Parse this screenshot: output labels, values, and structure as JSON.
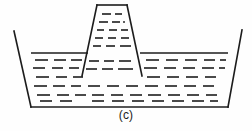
{
  "figure": {
    "caption": "(c)",
    "background_color": "#fefefe",
    "line_color": "#1c1c1c",
    "dash_color": "#2a2a2a"
  },
  "chart_data": {
    "type": "diagram",
    "title": "(c)",
    "canvas": {
      "width": 252,
      "height": 131
    },
    "elements": {
      "vessel": {
        "name": "vessel-outline",
        "left_wall": {
          "x1": 14,
          "y1": 31,
          "x2": 31,
          "y2": 107
        },
        "bottom": {
          "x1": 31,
          "y1": 107,
          "x2": 228,
          "y2": 107
        },
        "right_wall": {
          "x1": 228,
          "y1": 107,
          "x2": 242,
          "y2": 30
        }
      },
      "free_surface": {
        "name": "liquid-surface-line",
        "level_y": 53,
        "left_segment": {
          "x1": 31,
          "y1": 53,
          "x2": 88,
          "y2": 53
        },
        "right_segment": {
          "x1": 140,
          "y1": 53,
          "x2": 228,
          "y2": 53
        }
      },
      "standpipe": {
        "name": "standpipe-outline",
        "top_edge": {
          "x1": 97,
          "y1": 5,
          "x2": 127,
          "y2": 5
        },
        "left_wall": {
          "x1": 97,
          "y1": 5,
          "x2": 82,
          "y2": 76
        },
        "right_wall": {
          "x1": 127,
          "y1": 5,
          "x2": 142,
          "y2": 76
        },
        "rise_above_surface": 48
      }
    },
    "hatching": {
      "style": "short horizontal dashes",
      "standpipe_rows": [
        {
          "y": 14,
          "dashes": [
            [
              102,
              111
            ],
            [
              115,
              122
            ]
          ]
        },
        {
          "y": 22,
          "dashes": [
            [
              99,
              108
            ],
            [
              112,
              120
            ],
            [
              123,
              125
            ]
          ]
        },
        {
          "y": 30,
          "dashes": [
            [
              97,
              104
            ],
            [
              109,
              117
            ],
            [
              121,
              128
            ]
          ]
        },
        {
          "y": 38,
          "dashes": [
            [
              95,
              103
            ],
            [
              108,
              116
            ],
            [
              121,
              129
            ]
          ]
        },
        {
          "y": 46,
          "dashes": [
            [
              93,
              101
            ],
            [
              106,
              115
            ],
            [
              120,
              131
            ]
          ]
        },
        {
          "y": 61,
          "dashes": [
            [
              89,
              99
            ],
            [
              104,
              114
            ],
            [
              119,
              131
            ]
          ]
        },
        {
          "y": 69,
          "dashes": [
            [
              86,
              97
            ],
            [
              102,
              113
            ],
            [
              118,
              133
            ]
          ]
        }
      ],
      "left_pool_rows": [
        {
          "y": 60,
          "dashes": [
            [
              35,
              48
            ],
            [
              54,
              66
            ],
            [
              71,
              82
            ]
          ]
        },
        {
          "y": 68,
          "dashes": [
            [
              33,
              45
            ],
            [
              52,
              63
            ],
            [
              69,
              79
            ]
          ]
        },
        {
          "y": 77,
          "dashes": [
            [
              36,
              49
            ],
            [
              56,
              67
            ],
            [
              73,
              83
            ]
          ]
        },
        {
          "y": 86,
          "dashes": [
            [
              34,
              47
            ],
            [
              53,
              65
            ],
            [
              71,
              81
            ]
          ]
        },
        {
          "y": 95,
          "dashes": [
            [
              37,
              50
            ],
            [
              57,
              69
            ],
            [
              75,
              86
            ]
          ]
        },
        {
          "y": 101,
          "dashes": [
            [
              40,
              52
            ],
            [
              60,
              72
            ]
          ]
        }
      ],
      "right_pool_rows": [
        {
          "y": 60,
          "dashes": [
            [
              146,
              159
            ],
            [
              166,
              178
            ],
            [
              185,
              197
            ],
            [
              204,
              215
            ],
            [
              220,
              226
            ]
          ]
        },
        {
          "y": 68,
          "dashes": [
            [
              144,
              157
            ],
            [
              164,
              176
            ],
            [
              183,
              195
            ],
            [
              202,
              214
            ],
            [
              219,
              225
            ]
          ]
        },
        {
          "y": 77,
          "dashes": [
            [
              147,
              160
            ],
            [
              167,
              179
            ],
            [
              186,
              198
            ],
            [
              205,
              216
            ]
          ]
        },
        {
          "y": 86,
          "dashes": [
            [
              145,
              158
            ],
            [
              165,
              177
            ],
            [
              184,
              196
            ],
            [
              203,
              214
            ]
          ]
        },
        {
          "y": 95,
          "dashes": [
            [
              148,
              161
            ],
            [
              168,
              180
            ],
            [
              187,
              199
            ],
            [
              206,
              217
            ]
          ]
        },
        {
          "y": 101,
          "dashes": [
            [
              92,
              104
            ],
            [
              112,
              124
            ],
            [
              132,
              144
            ],
            [
              152,
              164
            ],
            [
              172,
              184
            ],
            [
              192,
              204
            ],
            [
              210,
              218
            ]
          ]
        }
      ],
      "center_pool_rows": [
        {
          "y": 86,
          "dashes": [
            [
              88,
              100
            ],
            [
              107,
              119
            ],
            [
              126,
              138
            ]
          ]
        },
        {
          "y": 95,
          "dashes": [
            [
              92,
              104
            ],
            [
              111,
              123
            ],
            [
              130,
              142
            ]
          ]
        }
      ]
    }
  }
}
